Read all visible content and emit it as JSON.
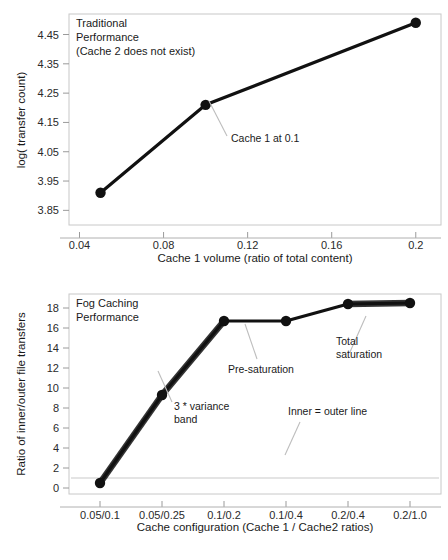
{
  "chart_data": [
    {
      "id": "traditional",
      "type": "line",
      "title": "Traditional Performance (Cache 2 does not exist)",
      "title_lines": [
        "Traditional",
        "Performance",
        "(Cache 2 does not exist)"
      ],
      "xlabel": "Cache 1 volume (ratio of total content)",
      "ylabel": "log( transfer count)",
      "x": [
        0.05,
        0.1,
        0.2
      ],
      "values": [
        3.91,
        4.21,
        4.49
      ],
      "xlim": [
        0.035,
        0.212
      ],
      "ylim": [
        3.8,
        4.52
      ],
      "xticks": [
        0.04,
        0.08,
        0.12,
        0.16,
        0.2
      ],
      "xtick_labels": [
        "0.04",
        "0.08",
        "0.12",
        "0.16",
        "0.2"
      ],
      "yticks": [
        3.85,
        3.95,
        4.05,
        4.15,
        4.25,
        4.35,
        4.45
      ],
      "ytick_labels": [
        "3.85",
        "3.95",
        "4.05",
        "4.15",
        "4.25",
        "4.35",
        "4.45"
      ],
      "grid": false,
      "legend": "none",
      "annotations": [
        {
          "text": "Cache 1 at 0.1",
          "x": 0.1,
          "y": 4.21
        }
      ]
    },
    {
      "id": "fog-caching",
      "type": "line",
      "title": "Fog Caching Performance",
      "title_lines": [
        "Fog Caching",
        "Performance"
      ],
      "xlabel": "Cache configuration (Cache 1 / Cache2 ratios)",
      "ylabel": "Ratio of inner/outer file transfers",
      "categories": [
        "0.05/0.1",
        "0.05/0.25",
        "0.1/0.2",
        "0.1/0.4",
        "0.2/0.4",
        "0.2/1.0"
      ],
      "values": [
        0.5,
        9.3,
        16.7,
        16.7,
        18.4,
        18.5
      ],
      "ylim": [
        -0.6,
        19.4
      ],
      "yticks": [
        0,
        2,
        4,
        6,
        8,
        10,
        12,
        14,
        16,
        18
      ],
      "ytick_labels": [
        "0",
        "2",
        "4",
        "6",
        "8",
        "10",
        "12",
        "14",
        "16",
        "18"
      ],
      "grid": false,
      "legend": "none",
      "reference_line": {
        "y": 1,
        "label": "Inner = outer line"
      },
      "variance_band_segments": [
        [
          0,
          1
        ],
        [
          1,
          2
        ],
        [
          4,
          5
        ]
      ],
      "annotations": [
        {
          "text": "3 * variance band",
          "lines": [
            "3 * variance",
            "band"
          ],
          "category": "0.05/0.25",
          "y": 9.3
        },
        {
          "text": "Pre-saturation",
          "lines": [
            "Pre-saturation"
          ],
          "category": "0.1/0.2",
          "y": 16.7
        },
        {
          "text": "Total saturation",
          "lines": [
            "Total",
            "saturation"
          ],
          "category": "0.2/0.4",
          "y": 18.4
        },
        {
          "text": "Inner = outer line",
          "lines": [
            "Inner = outer line"
          ],
          "category": "0.1/0.4",
          "y": 1
        }
      ]
    }
  ],
  "colors": {
    "line": "#111111",
    "frame": "#c8c8c8",
    "reference": "#c9c9c9",
    "leader": "#bdbdbd",
    "background": "#ffffff"
  }
}
